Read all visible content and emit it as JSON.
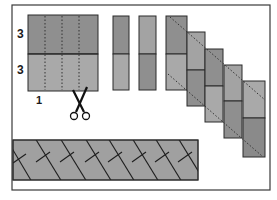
{
  "diagram": {
    "labels": {
      "top_height": "3",
      "bottom_height": "3",
      "strip_width": "1"
    },
    "icons": {
      "scissors": "scissors-icon"
    },
    "colors": {
      "frame": "#3a3a3a",
      "fabric_dark": "#8f8f8f",
      "fabric_light": "#a9a9a9",
      "seam": "#2a2a2a",
      "cut_line": "#333333",
      "background": "#ffffff"
    },
    "steps": [
      {
        "id": "sewn-block",
        "description": "Two strips sewn together, 3 and 3 tall, marked with dotted cut lines every 1 unit"
      },
      {
        "id": "cut-strips",
        "description": "Cut strip segments"
      },
      {
        "id": "staircase",
        "description": "Segments offset in a staircase with diagonal dotted trim lines"
      },
      {
        "id": "herringbone-band",
        "description": "Finished herringbone border band"
      }
    ]
  }
}
